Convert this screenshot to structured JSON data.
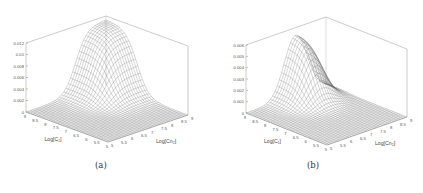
{
  "figure": {
    "panels": [
      {
        "id": "a",
        "caption": "(a)"
      },
      {
        "id": "b",
        "caption": "(b)"
      }
    ]
  },
  "chart_data": [
    {
      "type": "surface3d",
      "title": "",
      "caption": "(a)",
      "xlabel": "Log[C₁]",
      "ylabel": "Log[Cn₂]",
      "zlabel": "",
      "z_ticks": [
        "0",
        "0.002",
        "0.004",
        "0.006",
        "0.008",
        "0.01",
        "0.012"
      ],
      "zlim": [
        0,
        0.012
      ],
      "x_ticks": [
        "9",
        "8.5",
        "8",
        "7.5",
        "7",
        "6.5",
        "6",
        "5.5",
        "5"
      ],
      "y_ticks": [
        "5",
        "5.5",
        "6",
        "6.5",
        "7",
        "7.5",
        "8",
        "8.5",
        "9"
      ],
      "description": "Mesh surface near zero over most of the domain, rising to a ridge/peak of about 0.012 toward the back corner (high Log[C1], high Log[Cn2]).",
      "peak": 0.012,
      "grid": false
    },
    {
      "type": "surface3d",
      "title": "",
      "caption": "(b)",
      "xlabel": "Log[C₁]",
      "ylabel": "Log[Cn₂]",
      "zlabel": "",
      "z_ticks": [
        "0",
        "0.001",
        "0.002",
        "0.003",
        "0.004",
        "0.005",
        "0.006"
      ],
      "zlim": [
        0,
        0.006
      ],
      "x_ticks": [
        "9",
        "8.5",
        "8",
        "7.5",
        "7",
        "6.5",
        "6",
        "5.5",
        "5"
      ],
      "y_ticks": [
        "5",
        "5.5",
        "6",
        "6.5",
        "7",
        "7.5",
        "8",
        "8.5",
        "9"
      ],
      "description": "Mesh surface near zero over most of the domain, with a sharp ridge rising along the back-center toward about 0.005-0.006, steeper on the right side.",
      "peak": 0.0055,
      "grid": false
    }
  ]
}
